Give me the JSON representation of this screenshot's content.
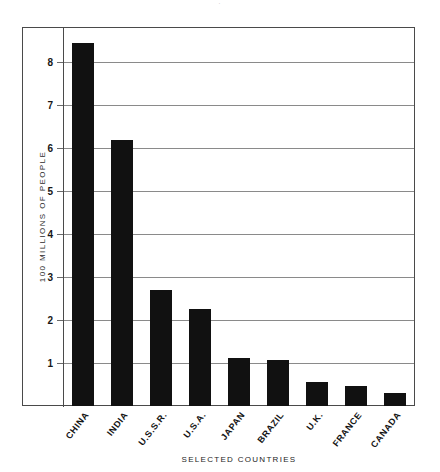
{
  "chart_data": {
    "type": "bar",
    "title": "",
    "xlabel": "SELECTED COUNTRIES",
    "ylabel": "100 MILLIONS OF PEOPLE",
    "categories": [
      "CHINA",
      "INDIA",
      "U.S.S.R.",
      "U.S.A.",
      "JAPAN",
      "BRAZIL",
      "U.K.",
      "FRANCE",
      "CANADA"
    ],
    "values": [
      8.45,
      6.2,
      2.7,
      2.25,
      1.12,
      1.08,
      0.55,
      0.47,
      0.3
    ],
    "ylim": [
      0,
      8.8
    ],
    "yticks": [
      1,
      2,
      3,
      4,
      5,
      6,
      7,
      8
    ],
    "ytick_labels": [
      "1",
      "2",
      "3",
      "4",
      "5",
      "6",
      "7",
      "8"
    ],
    "grid": true,
    "legend": "none",
    "bar_color": "#111111",
    "axis_color": "#4a4a4a",
    "grid_color": "#8a8a8a"
  },
  "title_mark": "·"
}
